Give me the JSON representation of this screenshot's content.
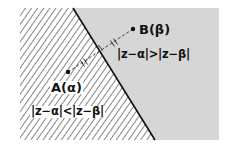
{
  "diagram": {
    "type": "complex-plane-perpendicular-bisector",
    "colors": {
      "background": "#ffffff",
      "near_b_region_fill": "#d6d6d6",
      "hatch_stroke": "#333333",
      "boundary_line": "#111111",
      "text": "#111111"
    },
    "points": {
      "a": {
        "label": "A(α)",
        "x": 68,
        "y": 72
      },
      "b": {
        "label": "B(β)",
        "x": 133,
        "y": 29
      }
    },
    "regions": {
      "left": {
        "label": "|z−α|<|z−β|",
        "fill": "hatched"
      },
      "right": {
        "label": "|z−α|>|z−β|",
        "fill": "gray"
      }
    },
    "boundary": {
      "description": "perpendicular bisector of AB",
      "from": [
        73,
        8
      ],
      "to": [
        155,
        140
      ]
    },
    "markers": {
      "equal_segment_ticks": "double",
      "right_angle": true
    }
  }
}
